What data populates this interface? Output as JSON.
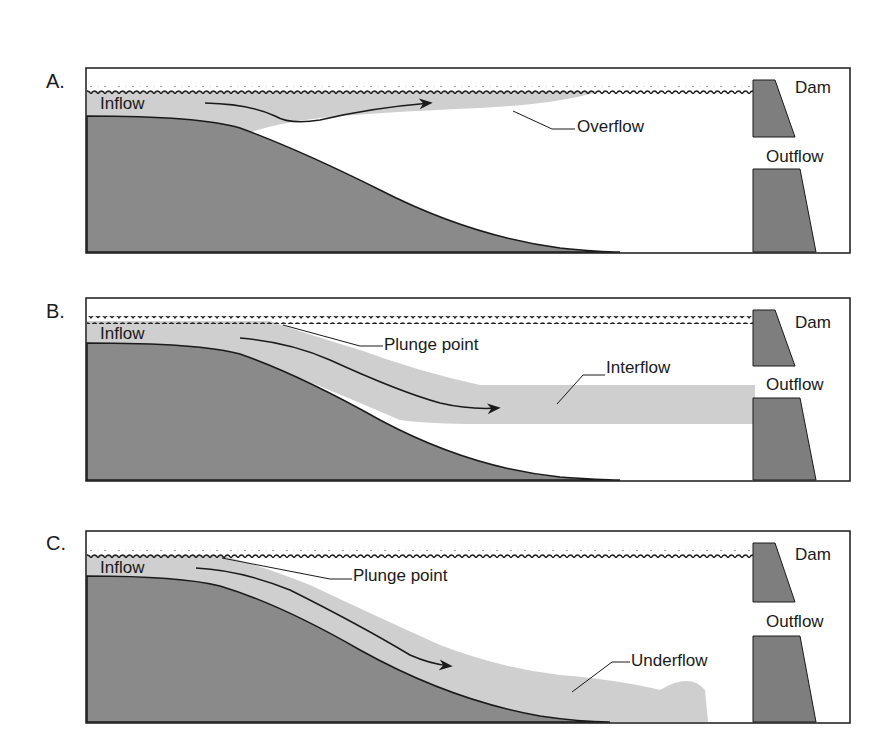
{
  "figure": {
    "colors": {
      "ground": "#8a8a8a",
      "flow": "#cfcfcf",
      "dam": "#7e7e7e",
      "line": "#1a1a1a",
      "water_bg": "#ffffff"
    },
    "panels": [
      {
        "letter": "A.",
        "title_y": 60,
        "box": [
          86,
          68,
          764,
          185
        ],
        "labels": {
          "inflow": "Inflow",
          "flow": "Overflow",
          "dam": "Dam",
          "outflow": "Outflow"
        }
      },
      {
        "letter": "B.",
        "title_y": 290,
        "box": [
          86,
          298,
          764,
          183
        ],
        "labels": {
          "inflow": "Inflow",
          "plunge": "Plunge point",
          "flow": "Interflow",
          "dam": "Dam",
          "outflow": "Outflow"
        }
      },
      {
        "letter": "C.",
        "title_y": 523,
        "box": [
          86,
          531,
          764,
          192
        ],
        "labels": {
          "inflow": "Inflow",
          "plunge": "Plunge point",
          "flow": "Underflow",
          "dam": "Dam",
          "outflow": "Outflow"
        }
      }
    ]
  }
}
